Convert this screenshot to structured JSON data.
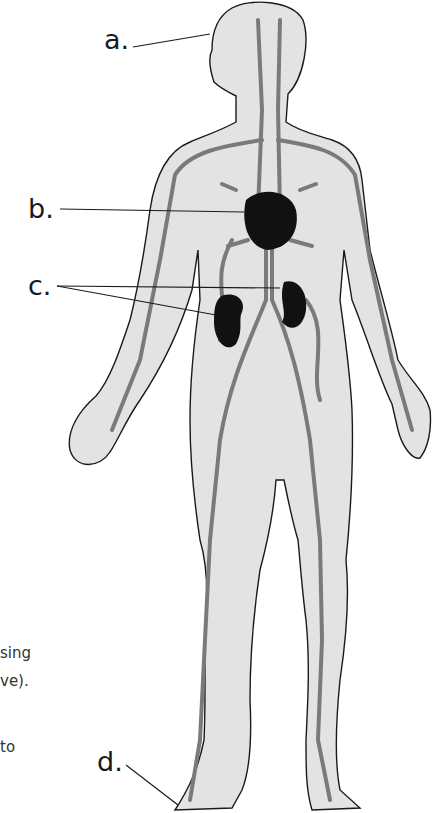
{
  "diagram": {
    "labels": [
      {
        "id": "a",
        "text": "a.",
        "points_to": "head"
      },
      {
        "id": "b",
        "text": "b.",
        "points_to": "heart"
      },
      {
        "id": "c",
        "text": "c.",
        "points_to": "kidneys"
      },
      {
        "id": "d",
        "text": "d.",
        "points_to": "foot"
      }
    ],
    "cropped_text_fragments": [
      "sing",
      "ve).",
      "to"
    ]
  },
  "colors": {
    "background": "#ffffff",
    "skin": "#e2e2e2",
    "vessel": "#8a8a8a",
    "outline": "#1a1a1a",
    "organ": "#111111"
  }
}
